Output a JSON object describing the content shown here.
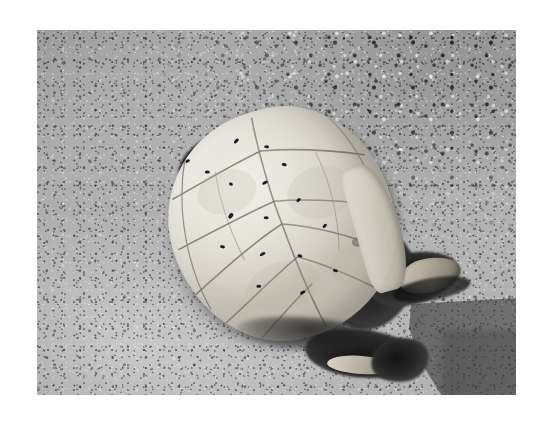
{
  "image": {
    "medium": "black-and-white photograph",
    "orientation": "landscape",
    "border": "white mat border surrounding the photograph",
    "border_color": "#ffffff",
    "photo_area": {
      "left": 37,
      "top": 30,
      "width": 479,
      "height": 365
    }
  },
  "scene": {
    "subject": "dead turtle lying upside down on sand",
    "setting": "sandy, pebbly ground in bright sunlight",
    "lighting": "hard directional sunlight casting a dark shadow toward the lower right"
  },
  "subject": {
    "name": "turtle",
    "pose": "plastron (belly shell) facing upward",
    "shell_label": "plastron",
    "shell_description": "pale bleached cream-white shell with visible scute seam lines forming a cross pattern",
    "shell_color": "#e6e3db",
    "seam_color": "#9a958a",
    "condition": "decomposed, desiccated carcass",
    "parts": [
      {
        "label": "head",
        "position": "right",
        "description": "dark dried head and neck extending to the right with open jaws"
      },
      {
        "label": "front-limb-left",
        "position": "upper-left",
        "description": "shriveled dark front flipper"
      },
      {
        "label": "front-limb-right",
        "position": "left",
        "description": "dark claw protruding from the shell edge"
      },
      {
        "label": "rear-limb",
        "position": "lower-right",
        "description": "dark rear limb and tail with pale bone fragments"
      },
      {
        "label": "bone-fragment",
        "position": "top",
        "description": "bright white exposed bone fragment above the shell"
      }
    ],
    "insects": {
      "label": "flies",
      "description": "small dark flies resting on the pale shell surface",
      "count": 17,
      "color": "#1c1c1c"
    }
  },
  "ground": {
    "label": "sand",
    "texture": "fine grainy sand with scattered dark pebbles and light shell fragments",
    "base_color": "#ababab",
    "highlight_color": "#bcbcbc",
    "coarse_region": "upper right, coarser gravel with high-contrast pebbles"
  },
  "shadow": {
    "label": "cast shadow",
    "location": "lower right",
    "shape": "rectangular block shadow",
    "color": "#3e3e3e"
  },
  "palette": {
    "white": "#ffffff",
    "shell_light": "#f2f0ea",
    "shell_mid": "#d5d1c7",
    "sand_light": "#bcbcbc",
    "sand_mid": "#ababab",
    "sand_dark": "#8f8f8f",
    "shadow": "#3e3e3e",
    "tissue_dark": "#1c1c1c"
  },
  "bugs": [
    {
      "x": 36,
      "y": 28,
      "w": 5,
      "h": 3,
      "r": -18
    },
    {
      "x": 52,
      "y": 44,
      "w": 5,
      "h": 3,
      "r": 12
    },
    {
      "x": 88,
      "y": 22,
      "w": 6,
      "h": 3,
      "r": -30
    },
    {
      "x": 116,
      "y": 36,
      "w": 5,
      "h": 3,
      "r": 20
    },
    {
      "x": 72,
      "y": 62,
      "w": 4,
      "h": 3,
      "r": 40
    },
    {
      "x": 104,
      "y": 70,
      "w": 6,
      "h": 3,
      "r": -10
    },
    {
      "x": 128,
      "y": 58,
      "w": 5,
      "h": 3,
      "r": 25
    },
    {
      "x": 62,
      "y": 92,
      "w": 6,
      "h": 4,
      "r": -35
    },
    {
      "x": 96,
      "y": 104,
      "w": 5,
      "h": 3,
      "r": 15
    },
    {
      "x": 132,
      "y": 96,
      "w": 5,
      "h": 3,
      "r": -22
    },
    {
      "x": 46,
      "y": 120,
      "w": 5,
      "h": 3,
      "r": 28
    },
    {
      "x": 82,
      "y": 138,
      "w": 6,
      "h": 3,
      "r": -12
    },
    {
      "x": 118,
      "y": 150,
      "w": 5,
      "h": 3,
      "r": 34
    },
    {
      "x": 150,
      "y": 128,
      "w": 5,
      "h": 3,
      "r": -26
    },
    {
      "x": 70,
      "y": 168,
      "w": 5,
      "h": 3,
      "r": 18
    },
    {
      "x": 110,
      "y": 186,
      "w": 6,
      "h": 3,
      "r": -15
    },
    {
      "x": 148,
      "y": 174,
      "w": 5,
      "h": 3,
      "r": 30
    }
  ]
}
